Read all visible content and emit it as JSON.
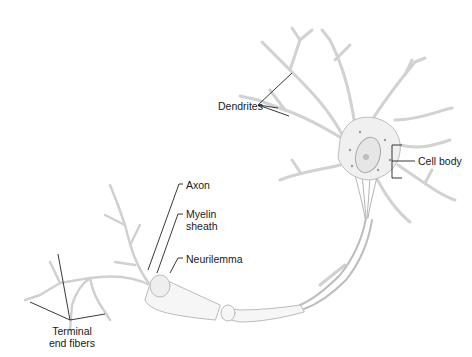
{
  "diagram": {
    "labels": {
      "dendrites": "Dendrites",
      "cell_body": "Cell body",
      "axon": "Axon",
      "myelin_line1": "Myelin",
      "myelin_line2": "sheath",
      "neurilemma": "Neurilemma",
      "terminal_line1": "Terminal",
      "terminal_line2": "end fibers"
    },
    "colors": {
      "background": "#ffffff",
      "leader_line": "#222222",
      "cell_fill": "#f2f2f2",
      "cell_stroke": "#b8b8b8",
      "text": "#1a1a1a"
    }
  }
}
